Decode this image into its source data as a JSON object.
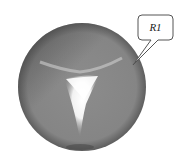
{
  "figure": {
    "callout": {
      "label": "R1"
    },
    "colors": {
      "body": "#8a8a8a",
      "edge_dark": "#5a5a5a",
      "highlight": "#ffffff",
      "callout_stroke": "#555555"
    }
  }
}
